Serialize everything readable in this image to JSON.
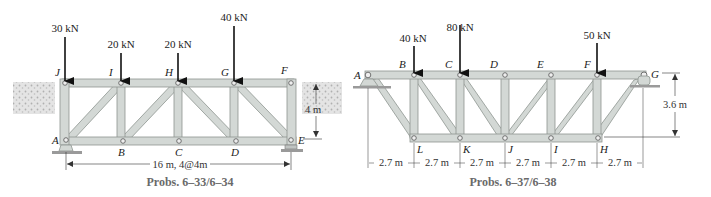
{
  "figures": [
    {
      "id": "left",
      "caption": "Probs. 6–33/6–34",
      "loads": [
        {
          "label": "30 kN",
          "joint": "J"
        },
        {
          "label": "20 kN",
          "joint": "I"
        },
        {
          "label": "20 kN",
          "joint": "H"
        },
        {
          "label": "40 kN",
          "joint": "G"
        }
      ],
      "top_joints": [
        "J",
        "I",
        "H",
        "G",
        "F"
      ],
      "bottom_joints": [
        "A",
        "B",
        "C",
        "D",
        "E"
      ],
      "span_dimension": "16 m, 4@4m",
      "height_dimension": "4 m"
    },
    {
      "id": "right",
      "caption": "Probs. 6–37/6–38",
      "loads": [
        {
          "label": "40 kN",
          "joint": "B"
        },
        {
          "label": "80 kN",
          "joint": "C"
        },
        {
          "label": "50 kN",
          "joint": "F"
        }
      ],
      "top_joints": [
        "A",
        "B",
        "C",
        "D",
        "E",
        "F",
        "G"
      ],
      "bottom_joints": [
        "L",
        "K",
        "J",
        "I",
        "H"
      ],
      "panel_dimensions": [
        "2.7 m",
        "2.7 m",
        "2.7 m",
        "2.7 m",
        "2.7 m",
        "2.7 m"
      ],
      "height_dimension": "3.6 m"
    }
  ],
  "colors": {
    "member_fill": "#d3d8d5",
    "member_edge": "#8e9590",
    "load_arrow": "#111111",
    "caption": "#6a6a6a",
    "ground": "#c9c9c9"
  }
}
